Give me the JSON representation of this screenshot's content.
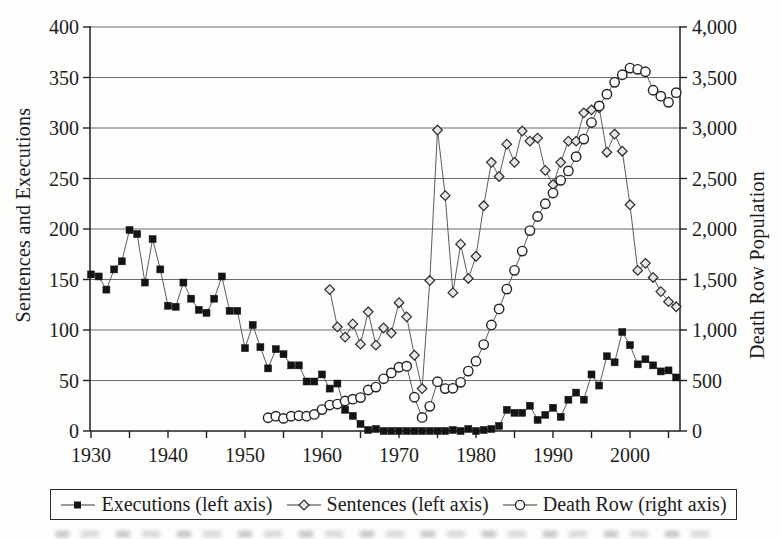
{
  "page": {
    "background": "#fdfdfb",
    "ink": "#1c1c1c"
  },
  "chart_data": {
    "type": "line",
    "title": "",
    "xlabel": "",
    "ylabel_left": "Sentences and Executions",
    "ylabel_right": "Death Row Population",
    "x_range": [
      1930,
      2006
    ],
    "x_major_ticks": [
      1930,
      1940,
      1950,
      1960,
      1970,
      1980,
      1990,
      2000
    ],
    "x_minor_tick_step": 5,
    "left_ylim": [
      0,
      400
    ],
    "left_ticks": [
      0,
      50,
      100,
      150,
      200,
      250,
      300,
      350,
      400
    ],
    "right_ylim": [
      0,
      4000
    ],
    "right_ticks": [
      0,
      500,
      1000,
      1500,
      2000,
      2500,
      3000,
      3500,
      4000
    ],
    "grid": "horizontal",
    "legend_position": "bottom",
    "line_color": "#4a4a4a",
    "axis_color": "#1f1f1f",
    "grid_color": "#5a5a5a",
    "series": [
      {
        "name": "Executions (left axis)",
        "axis": "left",
        "marker": "filled-square",
        "marker_fill": "#141414",
        "marker_stroke": "#141414",
        "start_year": 1930,
        "values": [
          155,
          153,
          140,
          160,
          168,
          199,
          195,
          147,
          190,
          160,
          124,
          123,
          147,
          131,
          120,
          117,
          131,
          153,
          119,
          119,
          82,
          105,
          83,
          62,
          81,
          76,
          65,
          65,
          49,
          49,
          56,
          42,
          47,
          21,
          15,
          7,
          1,
          2,
          0,
          0,
          0,
          0,
          0,
          0,
          0,
          0,
          0,
          1,
          0,
          2,
          0,
          1,
          2,
          5,
          21,
          18,
          18,
          25,
          11,
          16,
          23,
          14,
          31,
          38,
          31,
          56,
          45,
          74,
          68,
          98,
          85,
          66,
          71,
          65,
          59,
          60,
          53
        ]
      },
      {
        "name": "Sentences (left axis)",
        "axis": "left",
        "marker": "open-diamond",
        "marker_fill": "#e6e6e6",
        "marker_stroke": "#2b2b2b",
        "start_year": 1961,
        "values": [
          140,
          103,
          93,
          106,
          86,
          118,
          85,
          102,
          97,
          127,
          113,
          75,
          42,
          149,
          298,
          233,
          137,
          185,
          151,
          173,
          223,
          266,
          252,
          284,
          266,
          297,
          287,
          290,
          258,
          244,
          266,
          287,
          287,
          315,
          318,
          320,
          276,
          294,
          277,
          224,
          159,
          166,
          152,
          138,
          128,
          123
        ]
      },
      {
        "name": "Death Row (right axis)",
        "axis": "right",
        "marker": "open-circle",
        "marker_fill": "#fdfdfb",
        "marker_stroke": "#222222",
        "start_year": 1953,
        "values": [
          131,
          147,
          125,
          146,
          151,
          147,
          164,
          212,
          257,
          267,
          297,
          315,
          331,
          406,
          435,
          517,
          575,
          631,
          642,
          334,
          134,
          244,
          488,
          420,
          423,
          482,
          593,
          691,
          856,
          1050,
          1209,
          1405,
          1591,
          1781,
          1984,
          2124,
          2250,
          2356,
          2482,
          2575,
          2716,
          2890,
          3054,
          3219,
          3335,
          3452,
          3527,
          3593,
          3581,
          3557,
          3374,
          3315,
          3254,
          3350
        ]
      }
    ]
  }
}
